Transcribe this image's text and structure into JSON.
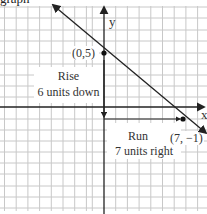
{
  "header": {
    "text": "graph"
  },
  "axes": {
    "x_label": "x",
    "y_label": "y"
  },
  "points": [
    {
      "label": "(0,5)",
      "x": 0,
      "y": 5
    },
    {
      "label": "(7, −1)",
      "x": 7,
      "y": -1
    }
  ],
  "annotations": {
    "rise_title": "Rise",
    "rise_detail": "6 units down",
    "run_title": "Run",
    "run_detail": "7 units right"
  },
  "colors": {
    "grid": "#c8c8c8",
    "axis": "#222222",
    "line": "#222222",
    "text": "#333333"
  }
}
